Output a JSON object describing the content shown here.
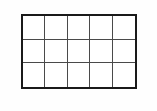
{
  "figure": {
    "kind": "grid-table-outline",
    "title": "",
    "columns": 5,
    "rows": 3,
    "cell_count": 15,
    "cells": [
      {
        "row": 1,
        "col": 1,
        "text": ""
      },
      {
        "row": 1,
        "col": 2,
        "text": ""
      },
      {
        "row": 1,
        "col": 3,
        "text": ""
      },
      {
        "row": 1,
        "col": 4,
        "text": ""
      },
      {
        "row": 1,
        "col": 5,
        "text": ""
      },
      {
        "row": 2,
        "col": 1,
        "text": ""
      },
      {
        "row": 2,
        "col": 2,
        "text": ""
      },
      {
        "row": 2,
        "col": 3,
        "text": ""
      },
      {
        "row": 2,
        "col": 4,
        "text": ""
      },
      {
        "row": 2,
        "col": 5,
        "text": ""
      },
      {
        "row": 3,
        "col": 1,
        "text": ""
      },
      {
        "row": 3,
        "col": 2,
        "text": ""
      },
      {
        "row": 3,
        "col": 3,
        "text": ""
      },
      {
        "row": 3,
        "col": 4,
        "text": ""
      },
      {
        "row": 3,
        "col": 5,
        "text": ""
      }
    ],
    "colors": {
      "page_background": "#fefefe",
      "cell_fill": "#ffffff",
      "outer_border": "#1a1a1a",
      "inner_rule": "#4a4a4a"
    },
    "geometry": {
      "left": 21,
      "top": 14,
      "width": 116,
      "height": 75,
      "outer_border_width": 2,
      "inner_rule_width": 1
    }
  }
}
